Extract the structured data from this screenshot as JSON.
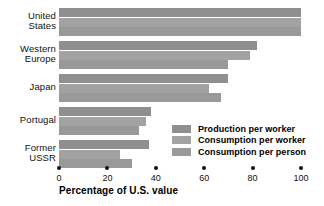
{
  "chart_data": {
    "type": "bar",
    "orientation": "horizontal",
    "title": "",
    "xlabel": "Percentage of U.S. value",
    "ylabel": "",
    "xlim": [
      0,
      100
    ],
    "xticks": [
      0,
      20,
      40,
      60,
      80,
      100
    ],
    "xtick_labels": [
      "0",
      "20",
      "40",
      "60",
      "80",
      "100"
    ],
    "grid": false,
    "legend_position": "inside-lower-right",
    "categories": [
      "United States",
      "Western Europe",
      "Japan",
      "Portugal",
      "Former USSR"
    ],
    "category_lines": [
      [
        "United",
        "States"
      ],
      [
        "Western",
        "Europe"
      ],
      [
        "Japan"
      ],
      [
        "Portugal"
      ],
      [
        "Former",
        "USSR"
      ]
    ],
    "series": [
      {
        "name": "Production per worker",
        "color": "#8f8f8f",
        "values": [
          100,
          82,
          70,
          38,
          37
        ]
      },
      {
        "name": "Consumption per worker",
        "color": "#a2a2a2",
        "values": [
          100,
          79,
          62,
          36,
          25
        ]
      },
      {
        "name": "Consumption per person",
        "color": "#999999",
        "values": [
          100,
          70,
          67,
          33,
          30
        ]
      }
    ]
  },
  "legend": {
    "items": [
      {
        "label": "Production per worker",
        "color": "#8f8f8f"
      },
      {
        "label": "Consumption per worker",
        "color": "#a2a2a2"
      },
      {
        "label": "Consumption per person",
        "color": "#999999"
      }
    ]
  },
  "axis": {
    "x_title": "Percentage of U.S. value"
  }
}
